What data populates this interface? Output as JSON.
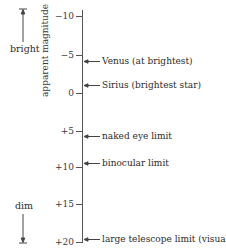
{
  "diagram": {
    "axis_label": "apparent magnitude",
    "direction": {
      "top_label": "bright",
      "bottom_label": "dim"
    },
    "ticks": [
      {
        "label": "−10",
        "value": -10,
        "y": 16
      },
      {
        "label": "−5",
        "value": -5,
        "y": 55
      },
      {
        "label": "0",
        "value": 0,
        "y": 93
      },
      {
        "label": "+5",
        "value": 5,
        "y": 131
      },
      {
        "label": "+10",
        "value": 10,
        "y": 167
      },
      {
        "label": "+15",
        "value": 15,
        "y": 204
      },
      {
        "label": "+20",
        "value": 20,
        "y": 242
      }
    ],
    "annotations": [
      {
        "label": "Venus (at brightest)",
        "magnitude": -4.4,
        "y": 61
      },
      {
        "label": "Sirius (brightest star)",
        "magnitude": -1.4,
        "y": 85
      },
      {
        "label": "naked eye limit",
        "magnitude": 6,
        "y": 136
      },
      {
        "label": "binocular limit",
        "magnitude": 9.5,
        "y": 163
      },
      {
        "label": "large telescope limit (visual)",
        "magnitude": 20,
        "y": 239
      }
    ],
    "colors": {
      "line": "#444444",
      "text": "#2b2b2b"
    }
  }
}
